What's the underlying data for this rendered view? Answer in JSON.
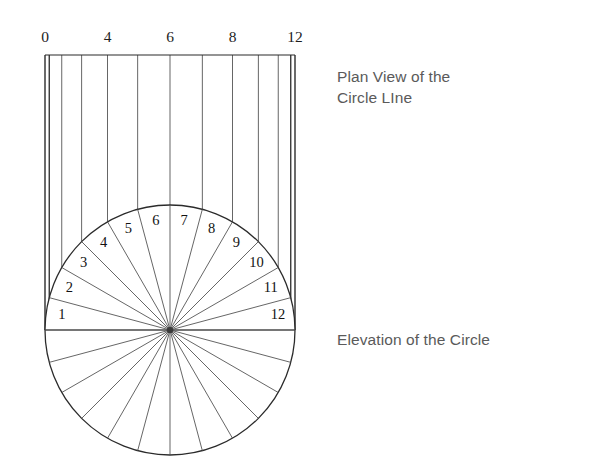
{
  "figure": {
    "title_plan": "Plan View of the\nCircle LIne",
    "title_elevation": "Elevation of the Circle"
  },
  "scale": {
    "ticks": [
      {
        "label": "0",
        "index": 0
      },
      {
        "label": "4",
        "index": 4
      },
      {
        "label": "6",
        "index": 6
      },
      {
        "label": "8",
        "index": 8
      },
      {
        "label": "12",
        "index": 12
      }
    ]
  },
  "circle": {
    "cx": 170,
    "cy": 330,
    "r": 125,
    "divisions": 24,
    "upper_sector_labels": [
      "1",
      "2",
      "3",
      "4",
      "5",
      "6",
      "7",
      "8",
      "9",
      "10",
      "11",
      "12"
    ]
  },
  "plan": {
    "top_y": 55,
    "bottom_y": 330,
    "line_count": 13
  },
  "chart_data": {
    "type": "line",
    "xlabel": "",
    "ylabel": "",
    "categories": [
      "0",
      "1",
      "2",
      "3",
      "4",
      "5",
      "6",
      "7",
      "8",
      "9",
      "10",
      "11",
      "12"
    ],
    "tick_labels_shown": [
      "0",
      "4",
      "6",
      "8",
      "12"
    ],
    "series": [
      {
        "name": "projected ordinate x-position (px)",
        "values": [
          45,
          49,
          61,
          81,
          108,
          137,
          170,
          203,
          232,
          259,
          279,
          291,
          295
        ]
      },
      {
        "name": "division angle from positive x-axis (degrees)",
        "values": [
          180,
          165,
          150,
          135,
          120,
          105,
          90,
          75,
          60,
          45,
          30,
          15,
          0
        ]
      }
    ],
    "grid": false,
    "legend": "none"
  }
}
